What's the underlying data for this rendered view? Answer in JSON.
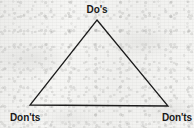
{
  "figure": {
    "kind": "triangle-diagram",
    "width": 194,
    "height": 128,
    "background_color": "#f6f6f4",
    "line_color": "#1c1c1c",
    "text_color": "#191919",
    "line_width": 1.3
  },
  "triangle": {
    "apex": {
      "x": 97,
      "y": 20
    },
    "bottom_left": {
      "x": 30,
      "y": 105
    },
    "bottom_right": {
      "x": 168,
      "y": 106
    }
  },
  "labels": {
    "top": "Do's",
    "bottom_left": "Don'ts",
    "bottom_right": "Don'ts"
  }
}
